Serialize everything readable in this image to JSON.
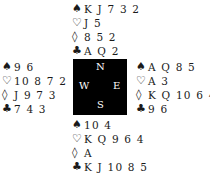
{
  "suits": {
    "spades": "♠",
    "hearts": "♡",
    "diamonds": "◊",
    "clubs": "♣"
  },
  "north": {
    "spades": "K J 7 3 2",
    "hearts": "J 5",
    "diamonds": "8 5 2",
    "clubs": "A Q 2"
  },
  "west": {
    "spades": "9 6",
    "hearts": "10 8 7 2",
    "diamonds": "J 9 7 3",
    "clubs": "7 4 3"
  },
  "east": {
    "spades": "A Q 8 5",
    "hearts": "A 3",
    "diamonds": "K Q 10 6 4",
    "clubs": "9 6"
  },
  "south": {
    "spades": "10 4",
    "hearts": "K Q 9 6 4",
    "diamonds": "A",
    "clubs": "K J 10 8 5"
  },
  "compass": {
    "n": "N",
    "s": "S",
    "e": "E",
    "w": "W"
  }
}
